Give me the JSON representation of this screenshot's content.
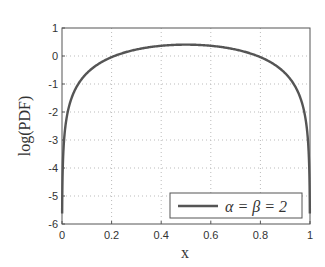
{
  "chart_data": {
    "type": "line",
    "title": "",
    "xlabel": "x",
    "ylabel": "log(PDF)",
    "xlim": [
      0,
      1
    ],
    "ylim": [
      -6,
      1
    ],
    "xticks": [
      "0",
      "0.2",
      "0.4",
      "0.6",
      "0.8",
      "1"
    ],
    "yticks": [
      "1",
      "0",
      "-1",
      "-2",
      "-3",
      "-4",
      "-5",
      "-6"
    ],
    "grid": true,
    "legend": {
      "position": "lower right",
      "entries": [
        "α = β = 2"
      ]
    },
    "series": [
      {
        "name": "α = β = 2",
        "function": "log(6x(1-x))",
        "x": [
          0.001,
          0.005,
          0.01,
          0.02,
          0.05,
          0.1,
          0.2,
          0.3,
          0.4,
          0.5,
          0.6,
          0.7,
          0.8,
          0.9,
          0.95,
          0.98,
          0.99,
          0.995,
          0.999
        ],
        "values": [
          -5.12,
          -3.51,
          -2.82,
          -2.14,
          -1.26,
          -0.62,
          -0.04,
          0.23,
          0.36,
          0.41,
          0.36,
          0.23,
          -0.04,
          -0.62,
          -1.26,
          -2.14,
          -2.82,
          -3.51,
          -5.12
        ]
      }
    ],
    "colors": {
      "line": "#555555",
      "axes": "#555555",
      "grid": "#bbbbbb"
    }
  }
}
